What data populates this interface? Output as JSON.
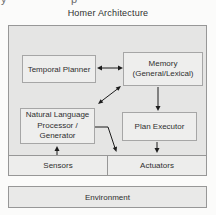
{
  "title": "Homer Architecture",
  "artifacts": {
    "top_fragment_left": "y",
    "top_fragment_mid": "p"
  },
  "diagram": {
    "nodes": {
      "temporal_planner": {
        "label": "Temporal Planner"
      },
      "memory": {
        "lines": [
          "Memory",
          "(General/Lexical)"
        ]
      },
      "nlp": {
        "lines": [
          "Natural Language",
          "Processor /",
          "Generator"
        ]
      },
      "plan_executor": {
        "label": "Plan Executor"
      },
      "sensors": {
        "label": "Sensors"
      },
      "actuators": {
        "label": "Actuators"
      },
      "environment": {
        "label": "Environment"
      }
    },
    "edges": [
      {
        "from": "Temporal Planner",
        "to": "Memory (General/Lexical)",
        "type": "bidirectional"
      },
      {
        "from": "Memory (General/Lexical)",
        "to": "Natural Language Processor / Generator",
        "type": "bidirectional"
      },
      {
        "from": "Memory (General/Lexical)",
        "to": "Plan Executor",
        "type": "directed"
      },
      {
        "from": "Plan Executor",
        "to": "Actuators",
        "type": "directed"
      },
      {
        "from": "Natural Language Processor / Generator",
        "to": "Actuators",
        "type": "directed"
      },
      {
        "from": "Sensors",
        "to": "Natural Language Processor / Generator",
        "type": "directed"
      }
    ]
  },
  "colors": {
    "bg": "#fbfbfa",
    "outer_fill": "#e5e5e4",
    "node_fill": "#eeeeed",
    "strip_fill": "#ededec",
    "env_fill": "#e9e9e8",
    "border": "#979797",
    "node_border": "#a6a6a6",
    "text": "#2f2f2f",
    "arrow": "#1c1c1c"
  }
}
